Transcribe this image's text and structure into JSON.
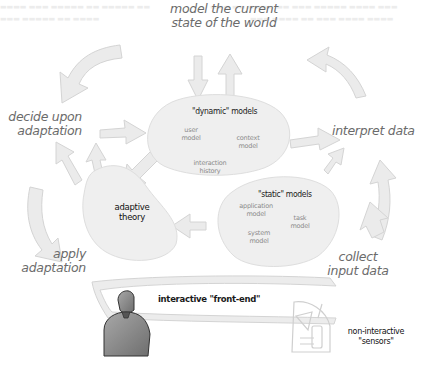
{
  "cycle_labels": {
    "model_world": [
      "model the current",
      "state of the world"
    ],
    "interpret": "interpret data",
    "collect": [
      "collect",
      "input data"
    ],
    "apply": [
      "apply",
      "adaptation"
    ],
    "decide": [
      "decide upon",
      "adaptation"
    ]
  },
  "dynamic_models": {
    "title": "\"dynamic\" models",
    "items": {
      "user": [
        "user",
        "model"
      ],
      "context": [
        "context",
        "model"
      ],
      "interaction": [
        "interaction",
        "history"
      ]
    }
  },
  "static_models": {
    "title": "\"static\" models",
    "items": {
      "application": [
        "application",
        "model"
      ],
      "task": [
        "task",
        "model"
      ],
      "system": [
        "system",
        "model"
      ]
    }
  },
  "adaptive_theory": [
    "adaptive",
    "theory"
  ],
  "front_end": "interactive \"front-end\"",
  "sensors": [
    "non-interactive",
    "\"sensors\""
  ],
  "colors": {
    "arrow_fill": "#ebebeb",
    "arrow_stroke": "#d2d2d2",
    "blob_fill": "#efefef",
    "label_text": "#6b6b6b",
    "dark_text": "#1a1a1a",
    "person_fill": "#8a8a8a"
  }
}
